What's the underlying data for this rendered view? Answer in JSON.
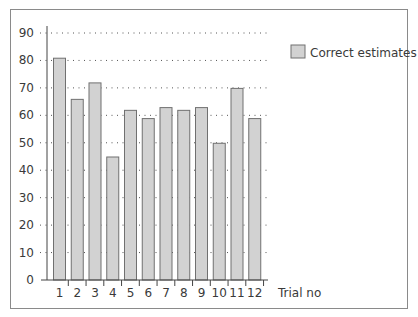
{
  "chart_data": {
    "type": "bar",
    "title": "",
    "xlabel": "Trial no",
    "ylabel": "",
    "categories": [
      "1",
      "2",
      "3",
      "4",
      "5",
      "6",
      "7",
      "8",
      "9",
      "10",
      "11",
      "12"
    ],
    "series": [
      {
        "name": "Correct estimates",
        "values": [
          81,
          66,
          72,
          45,
          62,
          59,
          63,
          62,
          63,
          50,
          70,
          59
        ]
      }
    ],
    "ylim": [
      0,
      90
    ],
    "yticks": [
      0,
      10,
      20,
      30,
      40,
      50,
      60,
      70,
      80,
      90
    ],
    "grid": "horizontal dotted",
    "legend_position": "top-right",
    "colors": {
      "bar_fill": "#d2d2d2",
      "bar_stroke": "#707070",
      "frame": "#8a8a8a"
    }
  },
  "legend": {
    "label": "Correct estimates"
  },
  "axis": {
    "xlabel": "Trial no"
  }
}
